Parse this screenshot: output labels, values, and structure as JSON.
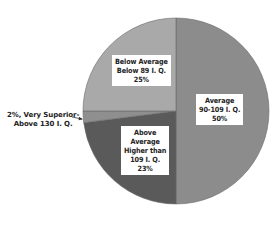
{
  "chart_data": {
    "type": "pie",
    "title": "",
    "categories": [
      "Average 90-109 I. Q.",
      "Above Average Higher than 109 I. Q.",
      "Very Superior Above 130 I. Q.",
      "Below Average Below 89 I. Q."
    ],
    "values": [
      50,
      23,
      2,
      25
    ],
    "unit": "%",
    "colors": [
      "#8c8c8c",
      "#5a5a5a",
      "#8f8f8f",
      "#a9a9a9"
    ],
    "legend": "none (labels inside/next to slices)"
  },
  "labels": {
    "average": {
      "line1": "Average",
      "line2": "90-109 I. Q.",
      "line3": "50%"
    },
    "below_average": {
      "line1": "Below Average",
      "line2": "Below 89 I. Q.",
      "line3": "25%"
    },
    "above_average": {
      "line1": "Above",
      "line2": "Average",
      "line3": "Higher than",
      "line4": "109 I. Q.",
      "line5": "23%"
    },
    "very_superior": {
      "line1": "2%, Very Superior-",
      "line2": "Above 130 I. Q."
    }
  }
}
